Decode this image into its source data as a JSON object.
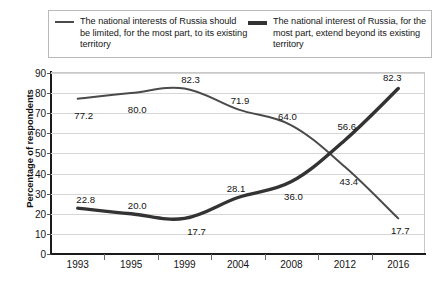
{
  "legend": {
    "entries": [
      {
        "label": "The national interests of Russia should be limited, for the most part, to its existing territory",
        "style": "thin",
        "color": "#4a4a4a"
      },
      {
        "label": "The national interest of Russia, for the most part, extend beyond its existing territory",
        "style": "thick",
        "color": "#333333"
      }
    ]
  },
  "axes": {
    "ylabel": "Percentage of respondents",
    "yticks": [
      "90",
      "80",
      "70",
      "60",
      "50",
      "40",
      "30",
      "20",
      "10",
      "0"
    ],
    "xticks": [
      "1993",
      "1995",
      "1999",
      "2004",
      "2008",
      "2012",
      "2016"
    ]
  },
  "chart_data": {
    "type": "line",
    "title": "",
    "xlabel": "",
    "ylabel": "Percentage of respondents",
    "categories": [
      "1993",
      "1995",
      "1999",
      "2004",
      "2008",
      "2012",
      "2016"
    ],
    "ylim": [
      0,
      90
    ],
    "ytick_step": 10,
    "grid": true,
    "legend_position": "top",
    "series": [
      {
        "name": "The national interests of Russia should be limited, for the most part, to its existing territory",
        "values": [
          77.2,
          80.0,
          82.3,
          71.9,
          64.0,
          43.4,
          17.7
        ],
        "labels": [
          "77.2",
          "80.0",
          "82.3",
          "71.9",
          "64.0",
          "43.4",
          "17.7"
        ],
        "color": "#4a4a4a",
        "width": 2
      },
      {
        "name": "The national interest of Russia, for the most part, extend beyond its existing territory",
        "values": [
          22.8,
          20.0,
          17.7,
          28.1,
          36.0,
          56.6,
          82.3
        ],
        "labels": [
          "22.8",
          "20.0",
          "17.7",
          "28.1",
          "36.0",
          "56.6",
          "82.3"
        ],
        "color": "#333333",
        "width": 3.4
      }
    ],
    "point_labels": [
      {
        "text": "77.2",
        "x": 0,
        "y": 77.2,
        "dx": 6,
        "dy": 16,
        "series": 0
      },
      {
        "text": "80.0",
        "x": 1,
        "y": 80.0,
        "dx": 6,
        "dy": 16,
        "series": 0
      },
      {
        "text": "82.3",
        "x": 2,
        "y": 82.3,
        "dx": 6,
        "dy": -9,
        "series": 0
      },
      {
        "text": "71.9",
        "x": 3,
        "y": 71.9,
        "dx": 2,
        "dy": -9,
        "series": 0
      },
      {
        "text": "64.0",
        "x": 4,
        "y": 64.0,
        "dx": -4,
        "dy": -9,
        "series": 0
      },
      {
        "text": "43.4",
        "x": 5,
        "y": 43.4,
        "dx": 4,
        "dy": 14,
        "series": 0
      },
      {
        "text": "17.7",
        "x": 6,
        "y": 17.7,
        "dx": 2,
        "dy": 12,
        "series": 0
      },
      {
        "text": "22.8",
        "x": 0,
        "y": 22.8,
        "dx": 8,
        "dy": -9,
        "series": 1
      },
      {
        "text": "20.0",
        "x": 1,
        "y": 20.0,
        "dx": 6,
        "dy": -9,
        "series": 1
      },
      {
        "text": "17.7",
        "x": 2,
        "y": 17.7,
        "dx": 12,
        "dy": 13,
        "series": 1
      },
      {
        "text": "28.1",
        "x": 3,
        "y": 28.1,
        "dx": -2,
        "dy": -9,
        "series": 1
      },
      {
        "text": "36.0",
        "x": 4,
        "y": 36.0,
        "dx": 2,
        "dy": 14,
        "series": 1
      },
      {
        "text": "56.6",
        "x": 5,
        "y": 56.6,
        "dx": 2,
        "dy": -14,
        "series": 1
      },
      {
        "text": "82.3",
        "x": 6,
        "y": 82.3,
        "dx": -6,
        "dy": -11,
        "series": 1
      }
    ]
  }
}
